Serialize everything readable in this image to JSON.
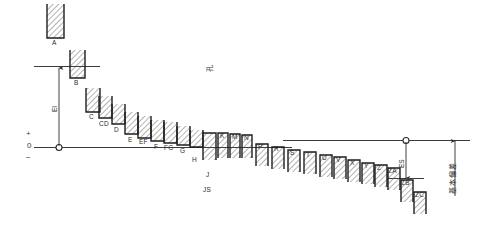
{
  "diagram": {
    "zero_line_label": "0",
    "plus_label": "+",
    "minus_label": "−",
    "axis": {
      "zero_y_note": "0",
      "ei_label": "EI",
      "es_label": "ES",
      "lower_group_label": "JS",
      "top_center_note": "孔",
      "right_note": "基本偏差"
    },
    "colors": {
      "line": "#3c3c3c",
      "hatch": "#4a4a4a",
      "bar_stroke": "#1e1e1e",
      "text": "#2b2b2b",
      "background": "#ffffff"
    },
    "bars": [
      {
        "label": "A",
        "x": 47,
        "w": 17,
        "top": 4,
        "bottom": 38
      },
      {
        "label": "B",
        "x": 70,
        "w": 15,
        "top": 50,
        "bottom": 78
      },
      {
        "label": "C",
        "x": 86,
        "w": 14,
        "top": 88,
        "bottom": 112
      },
      {
        "label": "CD",
        "x": 99,
        "w": 13,
        "top": 96,
        "bottom": 118
      },
      {
        "label": "D",
        "x": 112,
        "w": 13,
        "top": 104,
        "bottom": 124
      },
      {
        "label": "E",
        "x": 125,
        "w": 13,
        "top": 112,
        "bottom": 134
      },
      {
        "label": "EF",
        "x": 138,
        "w": 13,
        "top": 116,
        "bottom": 138
      },
      {
        "label": "F",
        "x": 151,
        "w": 13,
        "top": 120,
        "bottom": 141
      },
      {
        "label": "FG",
        "x": 164,
        "w": 13,
        "top": 122,
        "bottom": 143
      },
      {
        "label": "G",
        "x": 177,
        "w": 13,
        "top": 126,
        "bottom": 145
      },
      {
        "label": "H",
        "x": 190,
        "w": 13,
        "top": 130,
        "bottom": 147
      },
      {
        "label": "J",
        "x": 203,
        "w": 13,
        "top": 133,
        "bottom": 160
      },
      {
        "label": "K",
        "x": 218,
        "w": 10,
        "top": 133,
        "bottom": 158
      },
      {
        "label": "M",
        "x": 230,
        "w": 10,
        "top": 134,
        "bottom": 158
      },
      {
        "label": "N",
        "x": 242,
        "w": 10,
        "top": 135,
        "bottom": 158
      },
      {
        "label": "P",
        "x": 256,
        "w": 12,
        "top": 144,
        "bottom": 166
      },
      {
        "label": "R",
        "x": 272,
        "w": 12,
        "top": 147,
        "bottom": 169
      },
      {
        "label": "S",
        "x": 288,
        "w": 12,
        "top": 150,
        "bottom": 172
      },
      {
        "label": "T",
        "x": 304,
        "w": 12,
        "top": 152,
        "bottom": 174
      },
      {
        "label": "U",
        "x": 320,
        "w": 12,
        "top": 155,
        "bottom": 177
      },
      {
        "label": "V",
        "x": 334,
        "w": 12,
        "top": 157,
        "bottom": 179
      },
      {
        "label": "X",
        "x": 348,
        "w": 12,
        "top": 160,
        "bottom": 182
      },
      {
        "label": "Y",
        "x": 362,
        "w": 12,
        "top": 163,
        "bottom": 184
      },
      {
        "label": "Z",
        "x": 375,
        "w": 12,
        "top": 165,
        "bottom": 187
      },
      {
        "label": "ZA",
        "x": 388,
        "w": 12,
        "top": 168,
        "bottom": 190
      },
      {
        "label": "ZB",
        "x": 401,
        "w": 12,
        "top": 180,
        "bottom": 202
      },
      {
        "label": "ZC",
        "x": 414,
        "w": 12,
        "top": 192,
        "bottom": 214
      }
    ],
    "upper_labels": [
      {
        "text": "A",
        "x": 52,
        "y": 40
      },
      {
        "text": "B",
        "x": 74,
        "y": 80
      },
      {
        "text": "C",
        "x": 89,
        "y": 114
      },
      {
        "text": "CD",
        "x": 99,
        "y": 121
      },
      {
        "text": "D",
        "x": 114,
        "y": 127
      },
      {
        "text": "E",
        "x": 128,
        "y": 137
      },
      {
        "text": "EF",
        "x": 139,
        "y": 139
      },
      {
        "text": "F",
        "x": 154,
        "y": 144
      },
      {
        "text": "FG",
        "x": 164,
        "y": 145
      },
      {
        "text": "G",
        "x": 180,
        "y": 148
      },
      {
        "text": "H",
        "x": 192,
        "y": 157
      },
      {
        "text": "J",
        "x": 206,
        "y": 172
      },
      {
        "text": "K",
        "x": 220,
        "y": 133
      },
      {
        "text": "M",
        "x": 232,
        "y": 134
      },
      {
        "text": "N",
        "x": 244,
        "y": 135
      },
      {
        "text": "P",
        "x": 258,
        "y": 144
      },
      {
        "text": "R",
        "x": 274,
        "y": 146
      },
      {
        "text": "S",
        "x": 290,
        "y": 150
      },
      {
        "text": "T",
        "x": 306,
        "y": 152
      },
      {
        "text": "U",
        "x": 322,
        "y": 155
      },
      {
        "text": "V",
        "x": 336,
        "y": 157
      },
      {
        "text": "X",
        "x": 350,
        "y": 160
      },
      {
        "text": "Y",
        "x": 364,
        "y": 163
      },
      {
        "text": "Z",
        "x": 377,
        "y": 165
      },
      {
        "text": "ZA",
        "x": 388,
        "y": 168
      },
      {
        "text": "ZB",
        "x": 401,
        "y": 180
      },
      {
        "text": "ZC",
        "x": 415,
        "y": 192
      }
    ],
    "js_label": "JS",
    "ei_text": "EI",
    "es_text": "ES"
  }
}
